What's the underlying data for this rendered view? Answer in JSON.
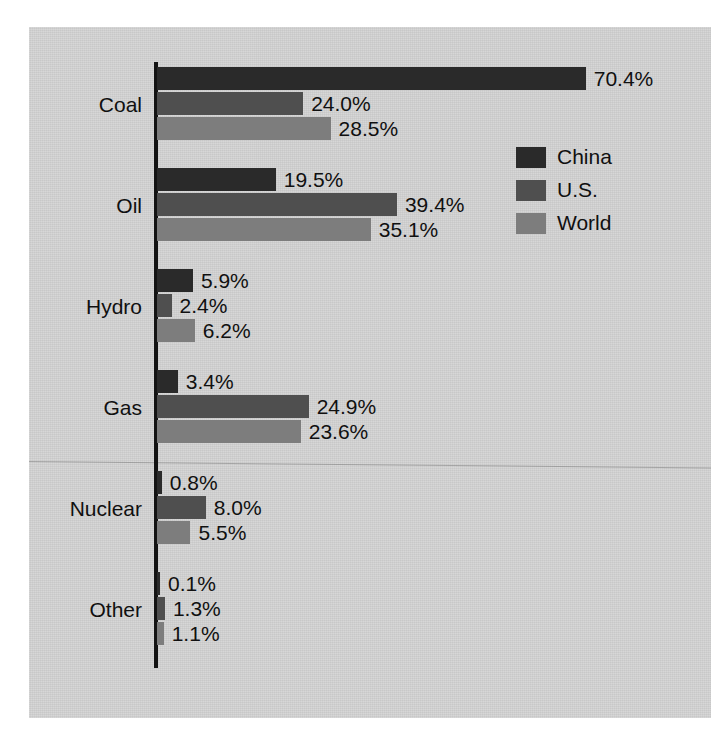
{
  "chart_data": {
    "type": "bar",
    "orientation": "horizontal",
    "title": "",
    "subtitle": "",
    "xlabel": "",
    "ylabel": "",
    "grid": false,
    "xlim": [
      0,
      70.4
    ],
    "axis_visible": "y-axis-only",
    "value_label_suffix": "%",
    "legend_position": "right-upper",
    "categories": [
      "Coal",
      "Oil",
      "Hydro",
      "Gas",
      "Nuclear",
      "Other"
    ],
    "series": [
      {
        "name": "China",
        "color": "#2a2a2a",
        "values": [
          70.4,
          19.5,
          5.9,
          3.4,
          0.8,
          0.1
        ],
        "labels": [
          "70.4%",
          "19.5%",
          "5.9%",
          "3.4%",
          "0.8%",
          "0.1%"
        ]
      },
      {
        "name": "U.S.",
        "color": "#4f4f4f",
        "values": [
          24.0,
          39.4,
          2.4,
          24.9,
          8.0,
          1.3
        ],
        "labels": [
          "24.0%",
          "39.4%",
          "2.4%",
          "24.9%",
          "8.0%",
          "1.3%"
        ]
      },
      {
        "name": "World",
        "color": "#7d7d7d",
        "values": [
          28.5,
          35.1,
          6.2,
          23.6,
          5.5,
          1.1
        ],
        "labels": [
          "28.5%",
          "35.1%",
          "6.2%",
          "23.6%",
          "5.5%",
          "1.1%"
        ]
      }
    ]
  },
  "legend": {
    "items": [
      {
        "label": "China",
        "color": "#2a2a2a"
      },
      {
        "label": "U.S.",
        "color": "#4f4f4f"
      },
      {
        "label": "World",
        "color": "#7d7d7d"
      }
    ]
  },
  "colors": {
    "paper": "#d4d4d4",
    "page": "#ffffff",
    "axis": "#131313",
    "text": "#101010"
  }
}
